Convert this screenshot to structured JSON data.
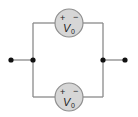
{
  "diagram": {
    "type": "circuit",
    "sources": [
      {
        "position": "top",
        "label": "V",
        "subscript": "0",
        "positive_sign": "+",
        "negative_sign": "−"
      },
      {
        "position": "bottom",
        "label": "V",
        "subscript": "0",
        "positive_sign": "+",
        "negative_sign": "−"
      }
    ],
    "terminals": [
      "left",
      "right"
    ],
    "colors": {
      "wire": "#8a8a8a",
      "source_fill": "#d6d6d6",
      "source_stroke": "#8f8f8f",
      "node": "#111111"
    }
  }
}
